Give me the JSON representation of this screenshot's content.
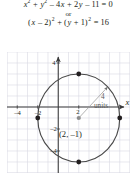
{
  "equations": {
    "line1": {
      "parts": [
        {
          "t": "x",
          "style": "italic"
        },
        {
          "t": "2",
          "style": "sup"
        },
        {
          "t": " + ",
          "style": "op"
        },
        {
          "t": "y",
          "style": "italic"
        },
        {
          "t": "2",
          "style": "sup"
        },
        {
          "t": " – 4",
          "style": "op"
        },
        {
          "t": "x",
          "style": "italic"
        },
        {
          "t": " + 2",
          "style": "op"
        },
        {
          "t": "y",
          "style": "italic"
        },
        {
          "t": " – 11 = 0",
          "style": "op"
        }
      ],
      "plain": "x² + y² – 4x + 2y – 11 = 0"
    },
    "connector": "or",
    "line2": {
      "parts": [
        {
          "t": "(",
          "style": "op"
        },
        {
          "t": "x",
          "style": "italic"
        },
        {
          "t": " – 2)",
          "style": "op"
        },
        {
          "t": "2",
          "style": "sup"
        },
        {
          "t": " + (",
          "style": "op"
        },
        {
          "t": "y",
          "style": "italic"
        },
        {
          "t": " + 1)",
          "style": "op"
        },
        {
          "t": "2",
          "style": "sup"
        },
        {
          "t": " = 16",
          "style": "op"
        }
      ],
      "plain": "(x – 2)² + (y + 1)² = 16"
    }
  },
  "chart_data": {
    "type": "scatter",
    "title": "",
    "xlabel": "x",
    "ylabel": "y",
    "xlim": [
      -5,
      7
    ],
    "ylim": [
      -6,
      5
    ],
    "grid": true,
    "grid_step": 1,
    "x_ticks": [
      -4,
      -2
    ],
    "x_tick_labels": [
      "–4",
      "–2"
    ],
    "y_ticks": [
      4,
      -2,
      -4
    ],
    "y_tick_labels": [
      "4",
      "–2",
      "–4"
    ],
    "origin_tick_label": "2",
    "circle": {
      "center": [
        2,
        -1
      ],
      "radius": 4,
      "center_label": "(2, –1)",
      "color": "#4a4a4a"
    },
    "radius_annotation": {
      "value": "4",
      "unit": "units",
      "from": [
        2,
        -1
      ],
      "to": [
        4.83,
        1.83
      ]
    },
    "points": [
      {
        "x": 2,
        "y": 3,
        "label": ""
      },
      {
        "x": 6,
        "y": -1,
        "label": ""
      },
      {
        "x": 2,
        "y": -5,
        "label": ""
      },
      {
        "x": -2,
        "y": -1,
        "label": ""
      }
    ],
    "center_point": {
      "x": 2,
      "y": -1
    },
    "colors": {
      "grid": "#d8d8e0",
      "axis": "#3a3a3a",
      "curve": "#4a4a4a",
      "point": "#231f20",
      "annotation": "#8a8a8a",
      "text": "#231f20"
    }
  }
}
